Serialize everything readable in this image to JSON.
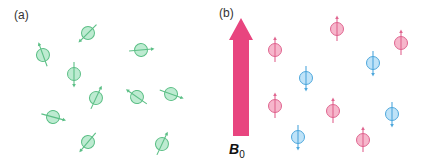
{
  "panels": {
    "a": {
      "label": "(a)"
    },
    "b": {
      "label": "(b)"
    }
  },
  "field": {
    "symbol": "B",
    "subscript": "0",
    "color": "#e8457f"
  },
  "colors": {
    "green_fill": "#bdebd1",
    "green_stroke": "#5cbf86",
    "pink_fill": "#f6b6cb",
    "pink_stroke": "#e0648f",
    "blue_fill": "#bfe3f8",
    "blue_stroke": "#4da7dc"
  },
  "spins_a": [
    {
      "x": 88,
      "y": 33,
      "angle": 225
    },
    {
      "x": 43,
      "y": 55,
      "angle": 340
    },
    {
      "x": 141,
      "y": 50,
      "angle": 85
    },
    {
      "x": 74,
      "y": 74,
      "angle": 180
    },
    {
      "x": 96,
      "y": 98,
      "angle": 25
    },
    {
      "x": 137,
      "y": 97,
      "angle": 305
    },
    {
      "x": 171,
      "y": 94,
      "angle": 110
    },
    {
      "x": 53,
      "y": 117,
      "angle": 105
    },
    {
      "x": 88,
      "y": 142,
      "angle": 220
    },
    {
      "x": 162,
      "y": 144,
      "angle": 25
    }
  ],
  "spins_b": [
    {
      "x": 275,
      "y": 50,
      "state": "up"
    },
    {
      "x": 337,
      "y": 29,
      "state": "up"
    },
    {
      "x": 401,
      "y": 43,
      "state": "up"
    },
    {
      "x": 306,
      "y": 78,
      "state": "down"
    },
    {
      "x": 373,
      "y": 63,
      "state": "down"
    },
    {
      "x": 275,
      "y": 106,
      "state": "up"
    },
    {
      "x": 333,
      "y": 111,
      "state": "up"
    },
    {
      "x": 392,
      "y": 114,
      "state": "down"
    },
    {
      "x": 298,
      "y": 137,
      "state": "down"
    },
    {
      "x": 363,
      "y": 140,
      "state": "up"
    }
  ]
}
